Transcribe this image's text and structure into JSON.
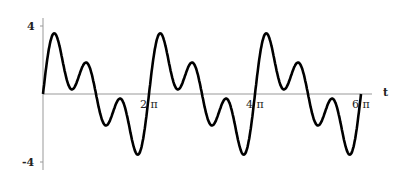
{
  "chart_data": {
    "type": "line",
    "title": "",
    "xlabel": "t",
    "ylabel": "",
    "xlim": [
      0,
      18.85
    ],
    "ylim": [
      -4,
      4
    ],
    "x_ticks": [
      {
        "value": 6.283,
        "label": "2 π"
      },
      {
        "value": 12.566,
        "label": "4 π"
      },
      {
        "value": 18.85,
        "label": "6 π"
      }
    ],
    "y_ticks": [
      {
        "value": 4,
        "label": "4"
      },
      {
        "value": -4,
        "label": "-4"
      }
    ],
    "grid": false,
    "series": [
      {
        "name": "f(t)",
        "approx_formula": "2 sin(t) + 2 sin(3t)",
        "period": "2π",
        "features": {
          "max": 3.5,
          "min": -3.5,
          "local_max": 1.0,
          "local_min": -1.0
        }
      }
    ]
  },
  "labels": {
    "x_axis": "t",
    "y_top": "4",
    "y_bottom": "-4",
    "x1": "2 π",
    "x2": "4 π",
    "x3": "6 π"
  }
}
